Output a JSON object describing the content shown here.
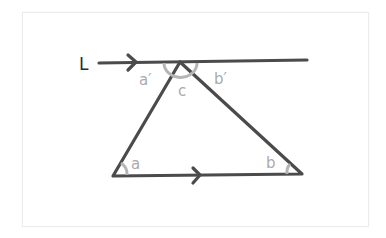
{
  "diagram": {
    "type": "geometry-triangle-parallel-line",
    "line_label": "L",
    "angle_labels": {
      "top_left": "a′",
      "apex": "c",
      "top_right": "b′",
      "bottom_left": "a",
      "bottom_right": "b"
    },
    "colors": {
      "line": "#4b4b4b",
      "angle_label": "#ababab",
      "line_label": "#2b2b2b",
      "card_border": "#ececec"
    },
    "points": {
      "apex": [
        180,
        62
      ],
      "bottom_left": [
        113,
        176
      ],
      "bottom_right": [
        302,
        174
      ],
      "line_start": [
        99,
        63
      ],
      "line_end": [
        307,
        60
      ]
    }
  }
}
